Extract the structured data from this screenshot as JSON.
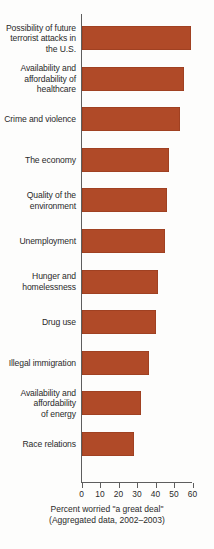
{
  "chart_data": {
    "type": "bar",
    "orientation": "horizontal",
    "title": "",
    "subtitle": "",
    "xlabel": "Percent worried \"a great deal\"",
    "xlabel_note": "(Aggregated data, 2002–2003)",
    "ylabel": "",
    "xlim": [
      0,
      60
    ],
    "xticks": [
      0,
      10,
      20,
      30,
      40,
      50,
      60
    ],
    "xtick_labels": [
      "0",
      "10",
      "20",
      "30",
      "40",
      "50",
      "60"
    ],
    "grid": false,
    "legend": "none",
    "bar_color": "#b04a28",
    "axis_color": "#5e5e5e",
    "categories": [
      "Possibility of future\nterrorist attacks in\nthe U.S.",
      "Availability and\naffordability of\nhealthcare",
      "Crime and violence",
      "The economy",
      "Quality of the\nenvironment",
      "Unemployment",
      "Hunger and\nhomelessness",
      "Drug use",
      "Illegal immigration",
      "Availability and\naffordability\nof energy",
      "Race relations"
    ],
    "values": [
      59,
      55,
      53,
      47,
      46,
      45,
      41,
      40,
      36,
      32,
      28
    ]
  }
}
